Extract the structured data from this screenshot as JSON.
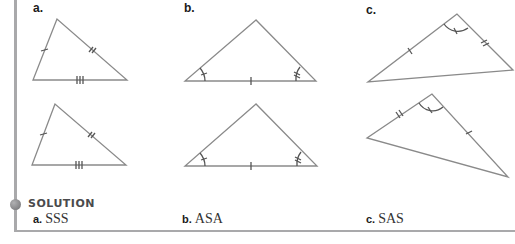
{
  "figures": {
    "a": {
      "label": "a.",
      "marks": "three pairs of congruent sides (single, double, triple tick)"
    },
    "b": {
      "label": "b.",
      "marks": "two pairs of congruent angles with included congruent side"
    },
    "c": {
      "label": "c.",
      "marks": "two pairs of congruent sides with included congruent angle"
    }
  },
  "solution": {
    "heading": "SOLUTION",
    "answers": [
      {
        "letter": "a.",
        "value": "SSS"
      },
      {
        "letter": "b.",
        "value": "ASA"
      },
      {
        "letter": "c.",
        "value": "SAS"
      }
    ]
  },
  "colors": {
    "line": "#8a8a8a",
    "rule": "#a9a9ab",
    "text": "#1a1a1a"
  }
}
